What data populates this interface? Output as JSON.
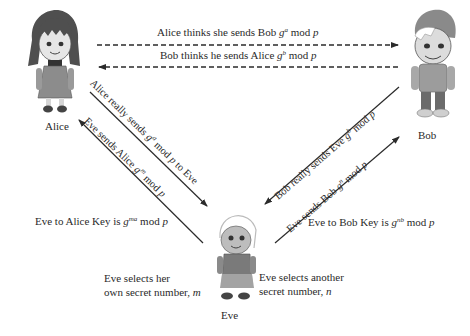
{
  "diagram": {
    "characters": [
      {
        "id": "alice",
        "name": "Alice"
      },
      {
        "id": "bob",
        "name": "Bob"
      },
      {
        "id": "eve",
        "name": "Eve"
      }
    ],
    "messages": {
      "alice_thinks": {
        "prefix": "Alice thinks she sends Bob ",
        "base": "g",
        "exp": "a",
        "suffix": " mod ",
        "mod": "p"
      },
      "bob_thinks": {
        "prefix": "Bob thinks he sends Alice ",
        "base": "g",
        "exp": "b",
        "suffix": " mod ",
        "mod": "p"
      },
      "alice_really": {
        "prefix": "Alice really sends ",
        "base": "g",
        "exp": "a",
        "suffix": " mod ",
        "mod": "p",
        "tail": " to Eve"
      },
      "eve_sends_alice": {
        "prefix": "Eve sends Alice ",
        "base": "g",
        "exp": "m",
        "suffix": " mod ",
        "mod": "p"
      },
      "bob_really": {
        "prefix": "Bob really sends Eve ",
        "base": "g",
        "exp": "b",
        "suffix": " mod ",
        "mod": "p"
      },
      "eve_sends_bob": {
        "prefix": "Eve sends Bob ",
        "base": "g",
        "exp": "n",
        "suffix": " mod ",
        "mod": "p"
      }
    },
    "keys": {
      "eve_alice": {
        "prefix": "Eve to Alice Key is ",
        "base": "g",
        "exp": "ma",
        "suffix": " mod ",
        "mod": "p"
      },
      "eve_bob": {
        "prefix": "Eve to Bob Key is ",
        "base": "g",
        "exp": "nb",
        "suffix": " mod ",
        "mod": "p"
      }
    },
    "notes": {
      "eve_secret_m": {
        "line1": "Eve selects her",
        "line2": "own secret number, ",
        "var": "m"
      },
      "eve_secret_n": {
        "line1": "Eve selects another",
        "line2": "secret number, ",
        "var": "n"
      }
    },
    "colors": {
      "line": "#2b2b2b",
      "text": "#2a2a2a",
      "figure_gray": "#8c8c8c",
      "figure_dark": "#4a4a4a"
    }
  }
}
